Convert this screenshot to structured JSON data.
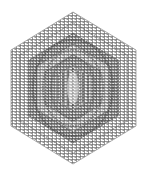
{
  "figure": {
    "background": "#ffffff",
    "stroke_color": "#555555",
    "hexagon": {
      "center": [
        73,
        88
      ],
      "top": [
        73,
        12
      ],
      "bottom": [
        73,
        164
      ],
      "left_x": 11,
      "right_x": 136,
      "upper_side_y": 50,
      "lower_side_y": 126
    },
    "rings": [
      {
        "scale": 1.0,
        "opacity": 0.35
      },
      {
        "scale": 0.86,
        "opacity": 0.5
      },
      {
        "scale": 0.72,
        "opacity": 0.7
      },
      {
        "scale": 0.58,
        "opacity": 0.65
      },
      {
        "scale": 0.44,
        "opacity": 0.55
      },
      {
        "scale": 0.3,
        "opacity": 0.5
      }
    ],
    "center_stripes": 7
  }
}
